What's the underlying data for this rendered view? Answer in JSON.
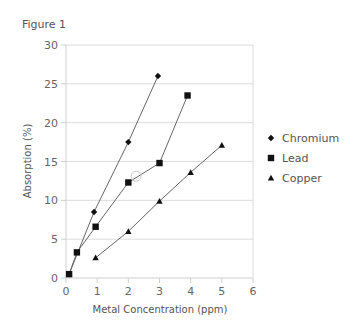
{
  "figure_title": "Figure 1",
  "chart_data": {
    "type": "line",
    "title": "",
    "xlabel": "Metal Concentration (ppm)",
    "ylabel": "Absorption (%)",
    "xlim": [
      0,
      6
    ],
    "ylim": [
      0,
      30
    ],
    "x_ticks": [
      "0",
      "1",
      "2",
      "3",
      "4",
      "5",
      "6"
    ],
    "y_ticks": [
      "0",
      "5",
      "10",
      "15",
      "20",
      "25",
      "30"
    ],
    "grid": "horizontal",
    "legend_position": "right",
    "series": [
      {
        "name": "Chromium",
        "marker": "diamond",
        "points": [
          [
            0.1,
            0.5
          ],
          [
            0.9,
            8.5
          ],
          [
            2.0,
            17.5
          ],
          [
            2.95,
            26.0
          ]
        ]
      },
      {
        "name": "Lead",
        "marker": "square",
        "points": [
          [
            0.1,
            0.5
          ],
          [
            0.35,
            3.3
          ],
          [
            0.95,
            6.6
          ],
          [
            2.0,
            12.3
          ],
          [
            3.0,
            14.8
          ],
          [
            3.9,
            23.5
          ]
        ]
      },
      {
        "name": "Copper",
        "marker": "triangle",
        "points": [
          [
            0.95,
            2.6
          ],
          [
            2.0,
            6.0
          ],
          [
            3.0,
            9.9
          ],
          [
            4.0,
            13.6
          ],
          [
            5.0,
            17.1
          ]
        ]
      }
    ],
    "annotations": [
      {
        "type": "open-circle",
        "x": 2.25,
        "y": 13.1
      }
    ]
  },
  "legend": {
    "items": [
      {
        "label": "Chromium",
        "marker": "diamond"
      },
      {
        "label": "Lead",
        "marker": "square"
      },
      {
        "label": "Copper",
        "marker": "triangle"
      }
    ]
  },
  "colors": {
    "series": "#111111",
    "line": "#666666",
    "grid": "#dcdcdc",
    "axis": "#cfcfcf",
    "text": "#555555"
  }
}
